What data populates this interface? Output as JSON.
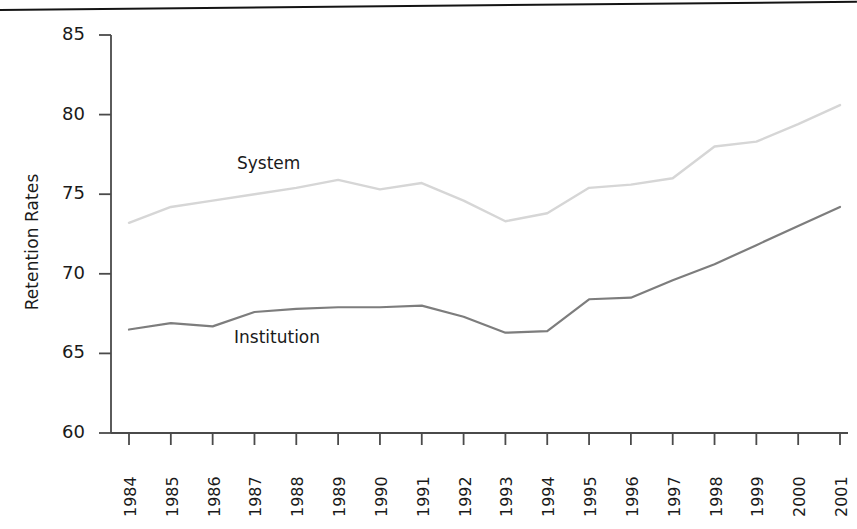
{
  "chart_data": {
    "type": "line",
    "title": "",
    "subtitle": "",
    "xlabel": "",
    "ylabel": "Retention Rates",
    "ylim": [
      60,
      85
    ],
    "ytick_labels": [
      "85",
      "80",
      "75",
      "70",
      "65",
      "60"
    ],
    "yticks": [
      85,
      80,
      75,
      70,
      65,
      60
    ],
    "grid": false,
    "legend_position": "inline-annotation",
    "categories": [
      "1984",
      "1985",
      "1986",
      "1987",
      "1988",
      "1989",
      "1990",
      "1991",
      "1992",
      "1993",
      "1994",
      "1995",
      "1996",
      "1997",
      "1998",
      "1999",
      "2000",
      "2001"
    ],
    "x": [
      1984,
      1985,
      1986,
      1987,
      1988,
      1989,
      1990,
      1991,
      1992,
      1993,
      1994,
      1995,
      1996,
      1997,
      1998,
      1999,
      2000,
      2001
    ],
    "series": [
      {
        "name": "System",
        "color": "#d6d6d6",
        "label_text": "System",
        "values": [
          73.2,
          74.2,
          74.6,
          75.0,
          75.4,
          75.9,
          75.3,
          75.7,
          74.6,
          73.3,
          73.8,
          75.4,
          75.6,
          76.0,
          78.0,
          78.3,
          79.4,
          80.6
        ]
      },
      {
        "name": "Institution",
        "color": "#7d7d7d",
        "label_text": "Institution",
        "values": [
          66.5,
          66.9,
          66.7,
          67.6,
          67.8,
          67.9,
          67.9,
          68.0,
          67.3,
          66.3,
          66.4,
          68.4,
          68.5,
          69.6,
          70.6,
          71.8,
          73.0,
          74.2
        ]
      }
    ]
  },
  "figure": {
    "axis_color": "#4a4a4a",
    "text_color": "#1a1a1a",
    "background": "#ffffff",
    "top_rule_color": "#141414"
  }
}
